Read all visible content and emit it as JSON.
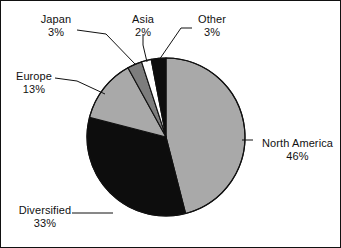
{
  "chart_data": {
    "type": "pie",
    "title": "",
    "subtitle": "",
    "xlabel": "",
    "ylabel": "",
    "legend_position": "none",
    "grid": false,
    "labels_show_percent": true,
    "start_angle_deg": 0,
    "direction": "clockwise",
    "categories": [
      "North America",
      "Diversified",
      "Europe",
      "Japan",
      "Asia",
      "Other"
    ],
    "values": [
      46,
      33,
      13,
      3,
      2,
      3
    ],
    "unit": "%",
    "slices": [
      {
        "name": "North America",
        "percent": 46,
        "percent_text": "46%",
        "color": "#a9a9a9",
        "start_deg": 0,
        "end_deg": 165.6,
        "label_side": "right"
      },
      {
        "name": "Diversified",
        "percent": 33,
        "percent_text": "33%",
        "color": "#0d0d0d",
        "start_deg": 165.6,
        "end_deg": 284.4,
        "label_side": "left"
      },
      {
        "name": "Europe",
        "percent": 13,
        "percent_text": "13%",
        "color": "#a9a9a9",
        "start_deg": 284.4,
        "end_deg": 331.2,
        "label_side": "left"
      },
      {
        "name": "Japan",
        "percent": 3,
        "percent_text": "3%",
        "color": "#7d7d7d",
        "start_deg": 331.2,
        "end_deg": 342.0,
        "label_side": "top"
      },
      {
        "name": "Asia",
        "percent": 2,
        "percent_text": "2%",
        "color": "#ffffff",
        "start_deg": 342.0,
        "end_deg": 349.2,
        "label_side": "top"
      },
      {
        "name": "Other",
        "percent": 3,
        "percent_text": "3%",
        "color": "#0d0d0d",
        "start_deg": 349.2,
        "end_deg": 360.0,
        "label_side": "top"
      }
    ],
    "geometry": {
      "center_x": 165,
      "center_y": 136,
      "radius": 79
    },
    "colors": {
      "background": "#ffffff",
      "outline": "#111111",
      "text": "#111111",
      "light_gray": "#a9a9a9",
      "medium_gray": "#7d7d7d",
      "black": "#0d0d0d",
      "white": "#ffffff"
    }
  },
  "labels": {
    "japan": {
      "name": "Japan",
      "percent": "3%"
    },
    "asia": {
      "name": "Asia",
      "percent": "2%"
    },
    "other": {
      "name": "Other",
      "percent": "3%"
    },
    "europe": {
      "name": "Europe",
      "percent": "13%"
    },
    "diversified": {
      "name": "Diversified",
      "percent": "33%"
    },
    "north_america": {
      "name": "North America",
      "percent": "46%"
    }
  }
}
